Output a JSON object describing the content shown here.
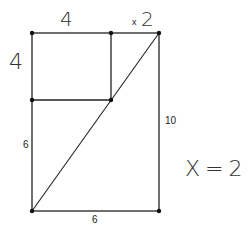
{
  "diagram": {
    "type": "geometry-figure",
    "points": {
      "top_left": [
        32,
        33
      ],
      "top_mid": [
        111,
        33
      ],
      "top_right": [
        159,
        33
      ],
      "mid_left": [
        32,
        100
      ],
      "mid_inner": [
        111,
        100
      ],
      "bottom_left": [
        32,
        211
      ],
      "bottom_right": [
        159,
        211
      ]
    },
    "line_color": "#222222"
  },
  "labels": {
    "top_side_handwritten": "4",
    "left_side_handwritten": "4",
    "top_x": "x",
    "top_x_value": "2",
    "left_lower": "6",
    "right_side": "10",
    "bottom_side": "6",
    "answer": "X = 2"
  }
}
